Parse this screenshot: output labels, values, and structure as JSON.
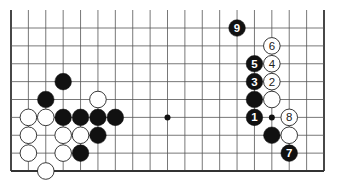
{
  "diagram": {
    "type": "go-board-fragment",
    "columns": 19,
    "rows_visible": 9,
    "edges": [
      "left",
      "right",
      "bottom"
    ],
    "colors": {
      "background": "#ffffff",
      "grid": "#555555",
      "edge": "#333333",
      "black_stone": "#111111",
      "white_stone": "#ffffff",
      "white_outline": "#222222",
      "black_label": "#ffffff",
      "white_label": "#222222"
    },
    "star_points": [
      {
        "col": 9,
        "row": 5
      },
      {
        "col": 15,
        "row": 5
      }
    ],
    "stones": [
      {
        "col": 1,
        "row": 5,
        "color": "white",
        "label": ""
      },
      {
        "col": 1,
        "row": 6,
        "color": "white",
        "label": ""
      },
      {
        "col": 1,
        "row": 7,
        "color": "white",
        "label": ""
      },
      {
        "col": 2,
        "row": 4,
        "color": "black",
        "label": ""
      },
      {
        "col": 2,
        "row": 5,
        "color": "white",
        "label": ""
      },
      {
        "col": 2,
        "row": 8,
        "color": "white",
        "label": ""
      },
      {
        "col": 3,
        "row": 3,
        "color": "black",
        "label": ""
      },
      {
        "col": 3,
        "row": 5,
        "color": "black",
        "label": ""
      },
      {
        "col": 3,
        "row": 6,
        "color": "white",
        "label": ""
      },
      {
        "col": 3,
        "row": 7,
        "color": "white",
        "label": ""
      },
      {
        "col": 4,
        "row": 5,
        "color": "black",
        "label": ""
      },
      {
        "col": 4,
        "row": 6,
        "color": "white",
        "label": ""
      },
      {
        "col": 4,
        "row": 7,
        "color": "black",
        "label": ""
      },
      {
        "col": 5,
        "row": 4,
        "color": "white",
        "label": ""
      },
      {
        "col": 5,
        "row": 5,
        "color": "black",
        "label": ""
      },
      {
        "col": 5,
        "row": 6,
        "color": "black",
        "label": ""
      },
      {
        "col": 6,
        "row": 5,
        "color": "black",
        "label": ""
      },
      {
        "col": 13,
        "row": 0,
        "color": "black",
        "label": "9"
      },
      {
        "col": 14,
        "row": 2,
        "color": "black",
        "label": "5"
      },
      {
        "col": 14,
        "row": 3,
        "color": "black",
        "label": "3"
      },
      {
        "col": 14,
        "row": 4,
        "color": "black",
        "label": ""
      },
      {
        "col": 14,
        "row": 5,
        "color": "black",
        "label": "1"
      },
      {
        "col": 15,
        "row": 1,
        "color": "white",
        "label": "6"
      },
      {
        "col": 15,
        "row": 2,
        "color": "white",
        "label": "4"
      },
      {
        "col": 15,
        "row": 3,
        "color": "white",
        "label": "2"
      },
      {
        "col": 15,
        "row": 4,
        "color": "white",
        "label": ""
      },
      {
        "col": 15,
        "row": 6,
        "color": "black",
        "label": ""
      },
      {
        "col": 16,
        "row": 5,
        "color": "white",
        "label": "8"
      },
      {
        "col": 16,
        "row": 6,
        "color": "white",
        "label": ""
      },
      {
        "col": 16,
        "row": 7,
        "color": "black",
        "label": "7"
      }
    ]
  }
}
